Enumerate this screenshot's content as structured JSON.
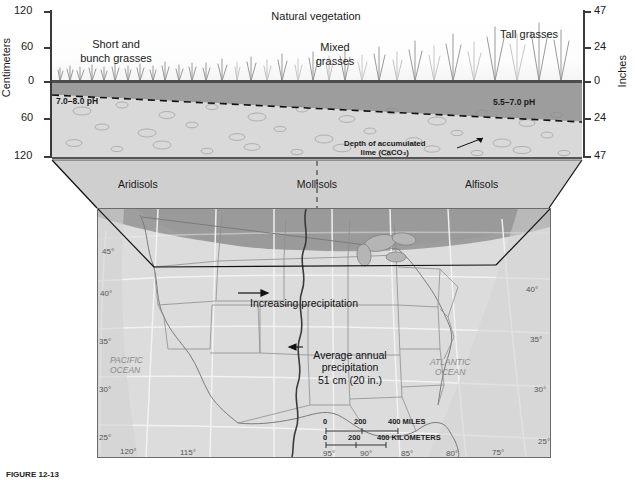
{
  "figure": {
    "caption": "FIGURE 12-13",
    "title": "Natural vegetation"
  },
  "cross_section": {
    "vegetation_title": "Natural vegetation",
    "zones": [
      {
        "label": "Short and\nbunch grasses",
        "line1": "Short and",
        "line2": "bunch grasses"
      },
      {
        "label": "Mixed\ngrasses",
        "line1": "Mixed",
        "line2": "grasses"
      },
      {
        "label": "Tall grasses",
        "line1": "Tall grasses",
        "line2": ""
      }
    ],
    "ph_left": "7.0–8.0 pH",
    "ph_right": "5.5–7.0 pH",
    "lime_label_line1": "Depth of accumulated",
    "lime_label_line2": "lime (CaCO₃)",
    "left_axis": {
      "title": "Centimeters",
      "ticks": [
        "120",
        "60",
        "0",
        "60",
        "120"
      ]
    },
    "right_axis": {
      "title": "Inches",
      "ticks": [
        "47",
        "24",
        "0",
        "24",
        "47"
      ]
    }
  },
  "soil_orders": [
    {
      "name": "Aridisols"
    },
    {
      "name": "Mollisols"
    },
    {
      "name": "Alfisols"
    }
  ],
  "map": {
    "oceans": [
      {
        "line1": "PACIFIC",
        "line2": "OCEAN"
      },
      {
        "line1": "ATLANTIC",
        "line2": "OCEAN"
      }
    ],
    "latitudes_left": [
      "45°",
      "40°",
      "35°",
      "30°",
      "25°"
    ],
    "latitudes_right": [
      "40°",
      "35°",
      "30°",
      "25°"
    ],
    "longitudes": [
      "120°",
      "115°",
      "95°",
      "90°",
      "85°",
      "80°",
      "75°"
    ],
    "annotations": {
      "increasing": "Increasing precipitation",
      "average_line1": "Average annual",
      "average_line2": "precipitation",
      "average_line3": "51 cm (20 in.)"
    },
    "scale": {
      "miles_ticks": [
        "0",
        "200",
        "400 MILES"
      ],
      "km_ticks": [
        "0",
        "200",
        "400 KILOMETERS"
      ]
    }
  },
  "colors": {
    "soil_upper": "#9d9d9d",
    "soil_lower": "#d9d9d9",
    "map_land": "#dcdcdc",
    "map_shade": "#9a9a9a",
    "grass": "#8c8c8c"
  }
}
